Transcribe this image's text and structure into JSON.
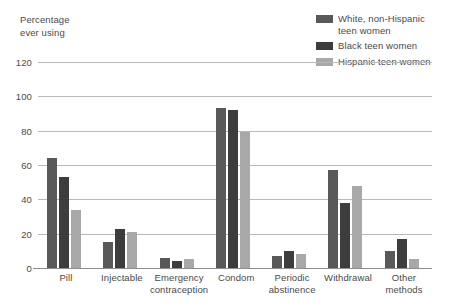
{
  "chart_data": {
    "type": "bar",
    "title": "",
    "subtitle": "",
    "ylabel": "Percentage\never using",
    "xlabel": "",
    "ylim": [
      0,
      120
    ],
    "yticks": [
      120,
      100,
      80,
      60,
      40,
      20,
      0
    ],
    "grid": true,
    "legend_position": "top-right",
    "categories": [
      "Pill",
      "Injectable",
      "Emergency\ncontraception",
      "Condom",
      "Periodic\nabstinence",
      "Withdrawal",
      "Other\nmethods"
    ],
    "series": [
      {
        "name": "White, non-Hispanic\nteen women",
        "color": "#595959",
        "values": [
          64,
          15,
          6,
          93,
          7,
          57,
          10
        ]
      },
      {
        "name": "Black teen women",
        "color": "#3d3d3d",
        "values": [
          53,
          23,
          4,
          92,
          10,
          38,
          17
        ]
      },
      {
        "name": "Hispanic teen women",
        "color": "#a8a8a8",
        "values": [
          34,
          21,
          5,
          79,
          8,
          48,
          5
        ]
      }
    ]
  },
  "colors": {
    "gridline": "#b9b9b9",
    "baseline": "#8d8d8d",
    "text": "#4a4a4a",
    "background": "#ffffff"
  }
}
